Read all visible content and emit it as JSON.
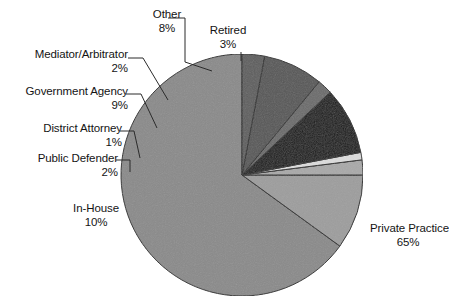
{
  "chart_data": {
    "type": "pie",
    "title": "",
    "xlabel": "",
    "ylabel": "",
    "legend_position": "none",
    "grid": false,
    "start_angle_deg": 90,
    "direction": "counterclockwise",
    "categories": [
      "Private Practice",
      "In-House",
      "Public Defender",
      "District Attorney",
      "Government Agency",
      "Mediator/Arbitrator",
      "Other",
      "Retired"
    ],
    "values": [
      65,
      10,
      2,
      1,
      9,
      2,
      8,
      3
    ],
    "value_unit": "%",
    "slices": [
      {
        "label": "Private Practice",
        "percent": 65,
        "percent_text": "65%",
        "color": "#8a8a8a"
      },
      {
        "label": "In-House",
        "percent": 10,
        "percent_text": "10%",
        "color": "#9d9d9d"
      },
      {
        "label": "Public Defender",
        "percent": 2,
        "percent_text": "2%",
        "color": "#a9a9a9"
      },
      {
        "label": "District Attorney",
        "percent": 1,
        "percent_text": "1%",
        "color": "#dcdcdc"
      },
      {
        "label": "Government Agency",
        "percent": 9,
        "percent_text": "9%",
        "color": "#181818"
      },
      {
        "label": "Mediator/Arbitrator",
        "percent": 2,
        "percent_text": "2%",
        "color": "#6b6b6b"
      },
      {
        "label": "Other",
        "percent": 8,
        "percent_text": "8%",
        "color": "#575757"
      },
      {
        "label": "Retired",
        "percent": 3,
        "percent_text": "3%",
        "color": "#5e5e5e"
      }
    ]
  },
  "labels": {
    "other": {
      "name": "Other",
      "pct": "8%"
    },
    "retired": {
      "name": "Retired",
      "pct": "3%"
    },
    "mediator": {
      "name": "Mediator/Arbitrator",
      "pct": "2%"
    },
    "govagency": {
      "name": "Government Agency",
      "pct": "9%"
    },
    "da": {
      "name": "District Attorney",
      "pct": "1%"
    },
    "pubdef": {
      "name": "Public Defender",
      "pct": "2%"
    },
    "inhouse": {
      "name": "In-House",
      "pct": "10%"
    },
    "private": {
      "name": "Private Practice",
      "pct": "65%"
    }
  },
  "colors": {
    "outline": "#2b2b2b",
    "background": "#ffffff",
    "text": "#141414"
  }
}
